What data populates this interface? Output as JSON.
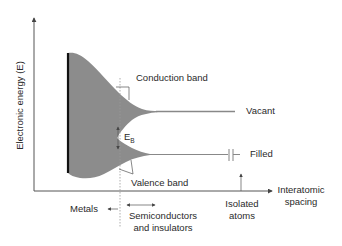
{
  "diagram": {
    "y_axis_label": "Electronic energy (E)",
    "x_axis_label_line1": "Interatomic",
    "x_axis_label_line2": "spacing",
    "conduction_band_label": "Conduction band",
    "valence_band_label": "Valence band",
    "gap_label_main": "E",
    "gap_label_sub": "B",
    "vacant_label": "Vacant",
    "filled_label": "Filled",
    "metals_label": "Metals",
    "semiconductors_line1": "Semiconductors",
    "semiconductors_line2": "and insulators",
    "isolated_line1": "Isolated",
    "isolated_line2": "atoms"
  },
  "colors": {
    "band_fill": "#8c8c8c",
    "axis": "#555555",
    "metal_edge": "#111111",
    "text": "#2a2a2a"
  }
}
